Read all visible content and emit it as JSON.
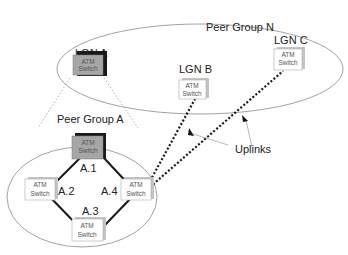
{
  "groups": {
    "peer_group_n": "Peer Group N",
    "peer_group_a": "Peer Group A"
  },
  "nodes": {
    "lgn_a": {
      "label": "LGN A",
      "line1": "ATM",
      "line2": "Switch"
    },
    "lgn_b": {
      "label": "LGN B",
      "line1": "ATM",
      "line2": "Switch"
    },
    "lgn_c": {
      "label": "LGN C",
      "line1": "ATM",
      "line2": "Switch"
    },
    "a1": {
      "label": "A.1",
      "line1": "ATM",
      "line2": "Switch"
    },
    "a2": {
      "label": "A.2",
      "line1": "ATM",
      "line2": "Switch"
    },
    "a3": {
      "label": "A.3",
      "line1": "ATM",
      "line2": "Switch"
    },
    "a4": {
      "label": "A.4",
      "line1": "ATM",
      "line2": "Switch"
    }
  },
  "annotations": {
    "uplinks": "Uplinks"
  },
  "colors": {
    "leader_fill": "#a6a6a6",
    "leader_shadow": "#1a1a1a",
    "switch_fill": "#ffffff",
    "switch_shadow": "#bdbdbd",
    "link": "#1a1a1a",
    "ellipse": "#888888"
  }
}
